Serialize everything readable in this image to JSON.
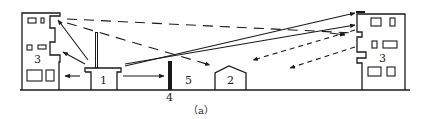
{
  "diagram": {
    "caption": "（a）",
    "labels": {
      "source_building": "1",
      "low_house": "2",
      "left_tall_building": "3",
      "right_tall_building": "3",
      "barrier_wall": "4",
      "open_ground": "5"
    },
    "colors": {
      "ink": "#1a1a1a",
      "background": "#ffffff"
    },
    "line_styles": {
      "direct_path": "solid arrow",
      "reflected_path": "long dash",
      "diffracted_path": "short dash arrow"
    }
  }
}
